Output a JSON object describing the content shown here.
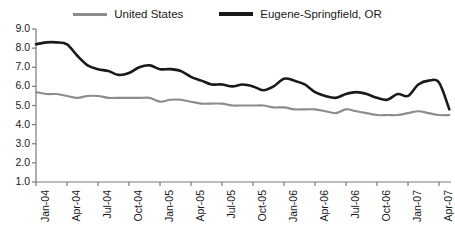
{
  "legend": {
    "position": "top-center",
    "entries": [
      {
        "label": "United States",
        "color": "#8c8c8c",
        "icon": "line-swatch-gray"
      },
      {
        "label": "Eugene-Springfield, OR",
        "color": "#1a1a1a",
        "icon": "line-swatch-black"
      }
    ]
  },
  "chart_data": {
    "type": "line",
    "title": "",
    "subtitle": "",
    "xlabel": "",
    "ylabel": "",
    "ylim": [
      1.0,
      9.0
    ],
    "ytick_step": 1.0,
    "ytick_labels": [
      "9.0",
      "8.0",
      "7.0",
      "6.0",
      "5.0",
      "4.0",
      "3.0",
      "2.0",
      "1.0"
    ],
    "ytick_values": [
      9.0,
      8.0,
      7.0,
      6.0,
      5.0,
      4.0,
      3.0,
      2.0,
      1.0
    ],
    "grid": false,
    "legend_position": "top-center",
    "x_tick_labels": [
      "Jan-04",
      "Apr-04",
      "Jul-04",
      "Oct-04",
      "Jan-05",
      "Apr-05",
      "Jul-05",
      "Oct-05",
      "Jan-06",
      "Apr-06",
      "Jul-06",
      "Oct-06",
      "Jan-07",
      "Apr-07"
    ],
    "x_tick_indices": [
      0,
      3,
      6,
      9,
      12,
      15,
      18,
      21,
      24,
      27,
      30,
      33,
      36,
      39
    ],
    "x": [
      "Jan-04",
      "Feb-04",
      "Mar-04",
      "Apr-04",
      "May-04",
      "Jun-04",
      "Jul-04",
      "Aug-04",
      "Sep-04",
      "Oct-04",
      "Nov-04",
      "Dec-04",
      "Jan-05",
      "Feb-05",
      "Mar-05",
      "Apr-05",
      "May-05",
      "Jun-05",
      "Jul-05",
      "Aug-05",
      "Sep-05",
      "Oct-05",
      "Nov-05",
      "Dec-05",
      "Jan-06",
      "Feb-06",
      "Mar-06",
      "Apr-06",
      "May-06",
      "Jun-06",
      "Jul-06",
      "Aug-06",
      "Sep-06",
      "Oct-06",
      "Nov-06",
      "Dec-06",
      "Jan-07",
      "Feb-07",
      "Mar-07",
      "Apr-07",
      "May-07"
    ],
    "series": [
      {
        "name": "Eugene-Springfield, OR",
        "color": "#1a1a1a",
        "values": [
          8.2,
          8.3,
          8.3,
          8.2,
          7.6,
          7.1,
          6.9,
          6.8,
          6.6,
          6.7,
          7.0,
          7.1,
          6.9,
          6.9,
          6.8,
          6.5,
          6.3,
          6.1,
          6.1,
          6.0,
          6.1,
          6.0,
          5.8,
          6.0,
          6.4,
          6.3,
          6.1,
          5.7,
          5.5,
          5.4,
          5.6,
          5.7,
          5.6,
          5.4,
          5.3,
          5.6,
          5.5,
          6.1,
          6.3,
          6.2,
          4.8
        ]
      },
      {
        "name": "United States",
        "color": "#8c8c8c",
        "values": [
          5.7,
          5.6,
          5.6,
          5.5,
          5.4,
          5.5,
          5.5,
          5.4,
          5.4,
          5.4,
          5.4,
          5.4,
          5.2,
          5.3,
          5.3,
          5.2,
          5.1,
          5.1,
          5.1,
          5.0,
          5.0,
          5.0,
          5.0,
          4.9,
          4.9,
          4.8,
          4.8,
          4.8,
          4.7,
          4.6,
          4.8,
          4.7,
          4.6,
          4.5,
          4.5,
          4.5,
          4.6,
          4.7,
          4.6,
          4.5,
          4.5
        ]
      }
    ]
  }
}
